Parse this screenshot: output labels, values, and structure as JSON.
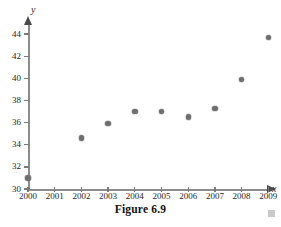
{
  "figure": {
    "caption": "Figure 6.9",
    "corner_marker_color": "#c9c9c9"
  },
  "chart_data": {
    "type": "scatter",
    "title": "",
    "subtitle": "",
    "xlabel": "x",
    "ylabel": "y",
    "xlim": [
      2000,
      2009
    ],
    "ylim": [
      30,
      44
    ],
    "grid": false,
    "legend": null,
    "point_color": "#6e6e6e",
    "axis_color": "#8c8c8c",
    "x_ticks": [
      "2000",
      "2001",
      "2002",
      "2003",
      "2004",
      "2005",
      "2006",
      "2007",
      "2008",
      "2009"
    ],
    "y_ticks": [
      "30",
      "32",
      "34",
      "36",
      "38",
      "40",
      "42",
      "44"
    ],
    "x": [
      2000,
      2002,
      2003,
      2004,
      2005,
      2006,
      2007,
      2008,
      2009
    ],
    "y": [
      31.0,
      34.6,
      35.9,
      37.0,
      37.0,
      36.5,
      37.3,
      39.9,
      43.7
    ],
    "points": [
      {
        "x": 2000,
        "y": 31.0
      },
      {
        "x": 2002,
        "y": 34.6
      },
      {
        "x": 2003,
        "y": 35.9
      },
      {
        "x": 2004,
        "y": 37.0
      },
      {
        "x": 2005,
        "y": 37.0
      },
      {
        "x": 2006,
        "y": 36.5
      },
      {
        "x": 2007,
        "y": 37.3
      },
      {
        "x": 2008,
        "y": 39.9
      },
      {
        "x": 2009,
        "y": 43.7
      }
    ]
  }
}
